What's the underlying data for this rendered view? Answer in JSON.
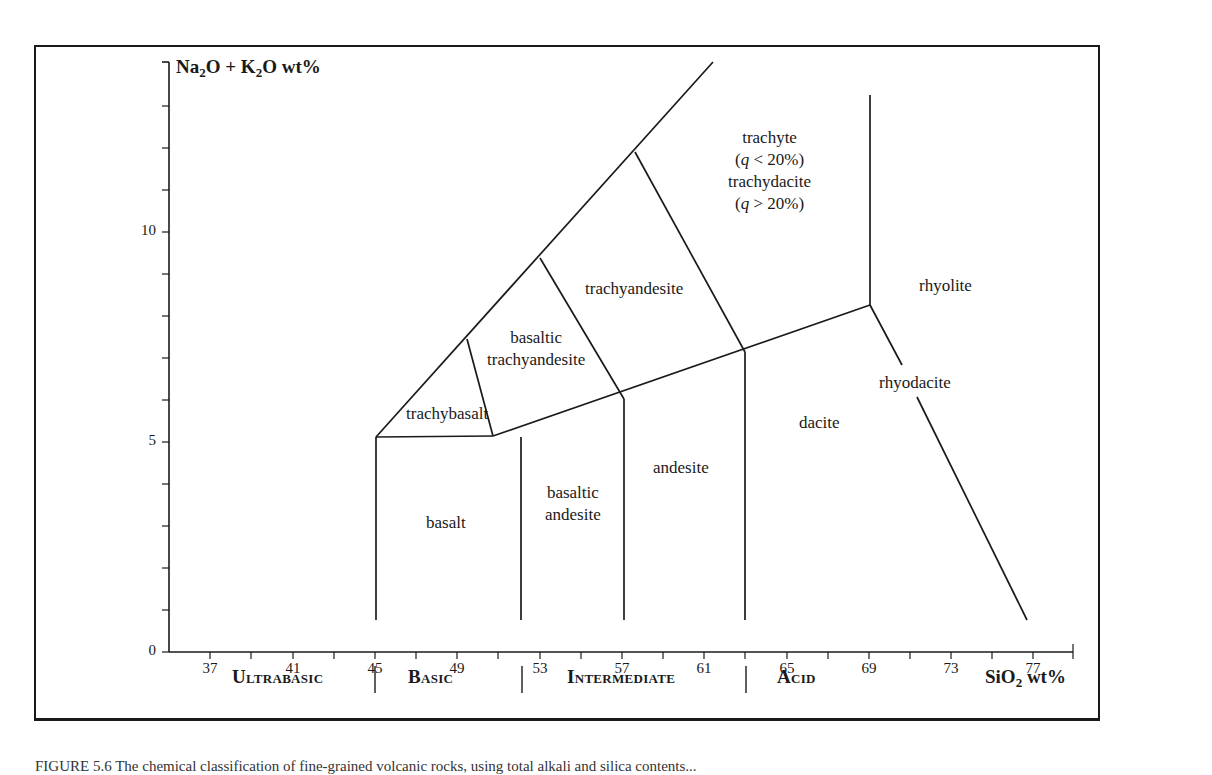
{
  "chart_data": {
    "type": "diagram",
    "xlabel": "SiO2 wt%",
    "ylabel": "Na2O + K2O wt%",
    "xlim": [
      35,
      79
    ],
    "ylim": [
      0,
      14
    ],
    "x_ticks": [
      37,
      41,
      45,
      49,
      53,
      57,
      61,
      65,
      69,
      73,
      77
    ],
    "x_minor_ticks": [
      35,
      39,
      43,
      47,
      51,
      55,
      59,
      63,
      67,
      71,
      75,
      79
    ],
    "y_ticks": [
      0,
      5,
      10
    ],
    "y_minor_ticks": [
      1,
      2,
      3,
      4,
      6,
      7,
      8,
      9,
      11,
      12,
      13,
      14
    ],
    "grid": false,
    "fields": [
      {
        "name": "basalt",
        "silica_range": [
          45,
          52
        ],
        "alkali_range": [
          0,
          5
        ]
      },
      {
        "name": "basaltic andesite",
        "silica_range": [
          52,
          57
        ],
        "alkali_range": [
          0,
          5.9
        ]
      },
      {
        "name": "andesite",
        "silica_range": [
          57,
          63
        ],
        "alkali_range": [
          0,
          7
        ]
      },
      {
        "name": "dacite",
        "silica_range": [
          63,
          69
        ],
        "alkali_range": [
          0,
          8
        ]
      },
      {
        "name": "rhyodacite",
        "silica_range": [
          69,
          77
        ],
        "alkali_range": [
          0,
          8
        ]
      },
      {
        "name": "rhyolite",
        "silica_range": [
          69,
          79
        ],
        "alkali_range": [
          8,
          14
        ]
      },
      {
        "name": "trachybasalt",
        "silica_range": [
          45,
          52
        ],
        "alkali_range": [
          5,
          7.3
        ]
      },
      {
        "name": "basaltic trachyandesite",
        "silica_range": [
          49.4,
          57
        ],
        "alkali_range": [
          5,
          9.3
        ]
      },
      {
        "name": "trachyandesite",
        "silica_range": [
          53,
          63
        ],
        "alkali_range": [
          5.9,
          11.7
        ]
      },
      {
        "name": "trachyte (q < 20%) / trachydacite (q > 20%)",
        "silica_range": [
          57.6,
          69
        ],
        "alkali_range": [
          7,
          14
        ]
      }
    ],
    "boundary_lines": [
      {
        "from": [
          45,
          0.5
        ],
        "to": [
          45,
          5.1
        ]
      },
      {
        "from": [
          52,
          0.5
        ],
        "to": [
          52,
          5.1
        ]
      },
      {
        "from": [
          57,
          0.5
        ],
        "to": [
          57,
          5.9
        ]
      },
      {
        "from": [
          63,
          0.5
        ],
        "to": [
          63,
          7.0
        ]
      },
      {
        "from": [
          45,
          5.1
        ],
        "to": [
          52,
          5.1
        ]
      },
      {
        "from": [
          52,
          5.1
        ],
        "to": [
          69,
          8.0
        ]
      },
      {
        "from": [
          45,
          5.1
        ],
        "to": [
          61.5,
          14.1
        ]
      },
      {
        "from": [
          49.4,
          7.3
        ],
        "to": [
          52,
          5.1
        ]
      },
      {
        "from": [
          53,
          9.3
        ],
        "to": [
          57,
          5.9
        ]
      },
      {
        "from": [
          57.6,
          11.7
        ],
        "to": [
          63,
          7.0
        ]
      },
      {
        "from": [
          69,
          8.0
        ],
        "to": [
          69,
          13.5
        ]
      },
      {
        "from": [
          69,
          8.0
        ],
        "to": [
          77,
          0.5
        ]
      }
    ],
    "silica_classes": [
      {
        "name": "Ultrabasic",
        "range": [
          35,
          45
        ]
      },
      {
        "name": "Basic",
        "range": [
          45,
          52
        ]
      },
      {
        "name": "Intermediate",
        "range": [
          52,
          63
        ]
      },
      {
        "name": "Acid",
        "range": [
          63,
          79
        ]
      }
    ]
  },
  "axes": {
    "y_title_parts": [
      "Na",
      "2",
      "O + K",
      "2",
      "O wt%"
    ],
    "x_title_parts": [
      "SiO",
      "2",
      " wt%"
    ],
    "y_tick_labels": [
      "10",
      "5",
      "0"
    ],
    "x_tick_labels": [
      "37",
      "41",
      "45",
      "49",
      "53",
      "57",
      "61",
      "65",
      "69",
      "73",
      "77"
    ]
  },
  "labels": {
    "trachyte": "trachyte",
    "trachyte_q": "(q < 20%)",
    "trachydacite": "trachydacite",
    "trachydacite_q": "(q > 20%)",
    "trachyandesite": "trachyandesite",
    "basaltic_trachyandesite_1": "basaltic",
    "basaltic_trachyandesite_2": "trachyandesite",
    "trachybasalt": "trachybasalt",
    "basalt": "basalt",
    "basaltic_andesite_1": "basaltic",
    "basaltic_andesite_2": "andesite",
    "andesite": "andesite",
    "dacite": "dacite",
    "rhyodacite": "rhyodacite",
    "rhyolite": "rhyolite"
  },
  "classes": [
    "Ultrabasic",
    "Basic",
    "Intermediate",
    "Acid"
  ],
  "caption": "FIGURE 5.6 The chemical classification of fine-grained volcanic rocks, using total alkali and silica contents..."
}
